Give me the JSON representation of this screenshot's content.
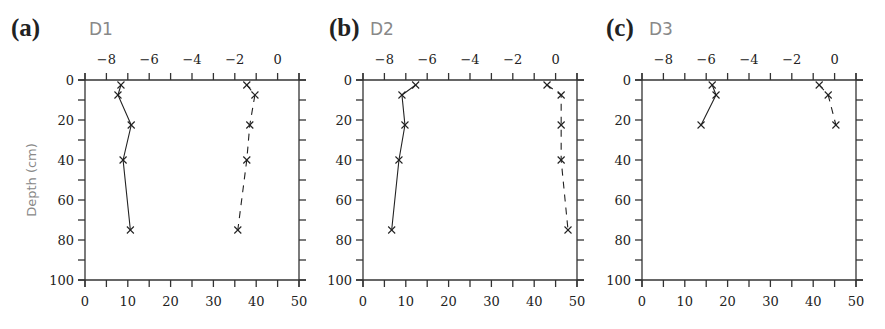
{
  "chart_data": [
    {
      "type": "line",
      "panel_label": "(a)",
      "title": "D1",
      "ylabel": "Depth (cm)",
      "ylim": [
        100,
        0
      ],
      "yticks": [
        0,
        20,
        40,
        60,
        80,
        100
      ],
      "x_bottom": {
        "range": [
          0,
          50
        ],
        "ticks": [
          0,
          10,
          20,
          30,
          40,
          50
        ]
      },
      "x_top": {
        "range": [
          -9,
          1
        ],
        "ticks": [
          -8,
          -6,
          -4,
          -2,
          0
        ]
      },
      "grid": false,
      "series": [
        {
          "name": "solid",
          "style": "solid",
          "marker": "x",
          "axis": "bottom",
          "x": [
            8.4,
            7.7,
            10.8,
            8.9,
            10.6
          ],
          "depth": [
            2.5,
            7.5,
            22.5,
            40,
            75
          ]
        },
        {
          "name": "dashed",
          "style": "dashed",
          "marker": "x",
          "axis": "bottom",
          "x": [
            37.8,
            39.7,
            38.5,
            37.8,
            35.7
          ],
          "depth": [
            2.5,
            7.5,
            22.5,
            40,
            75
          ]
        }
      ]
    },
    {
      "type": "line",
      "panel_label": "(b)",
      "title": "D2",
      "ylim": [
        100,
        0
      ],
      "yticks": [
        0,
        20,
        40,
        60,
        80,
        100
      ],
      "x_bottom": {
        "range": [
          0,
          50
        ],
        "ticks": [
          0,
          10,
          20,
          30,
          40,
          50
        ]
      },
      "x_top": {
        "range": [
          -9,
          1
        ],
        "ticks": [
          -8,
          -6,
          -4,
          -2,
          0
        ]
      },
      "grid": false,
      "series": [
        {
          "name": "solid",
          "style": "solid",
          "marker": "x",
          "axis": "bottom",
          "x": [
            12.3,
            9.1,
            9.8,
            8.4,
            6.7
          ],
          "depth": [
            2.5,
            7.5,
            22.5,
            40,
            75
          ]
        },
        {
          "name": "dashed",
          "style": "dashed",
          "marker": "x",
          "axis": "bottom",
          "x": [
            43.0,
            46.3,
            46.3,
            46.3,
            47.9
          ],
          "depth": [
            2.5,
            7.5,
            22.5,
            40,
            75
          ]
        }
      ]
    },
    {
      "type": "line",
      "panel_label": "(c)",
      "title": "D3",
      "ylim": [
        100,
        0
      ],
      "yticks": [
        0,
        20,
        40,
        60,
        80,
        100
      ],
      "x_bottom": {
        "range": [
          0,
          50
        ],
        "ticks": [
          0,
          10,
          20,
          30,
          40,
          50
        ]
      },
      "x_top": {
        "range": [
          -9,
          1
        ],
        "ticks": [
          -8,
          -6,
          -4,
          -2,
          0
        ]
      },
      "grid": false,
      "series": [
        {
          "name": "solid",
          "style": "solid",
          "marker": "x",
          "axis": "bottom",
          "x": [
            16.4,
            17.3,
            13.8
          ],
          "depth": [
            2.5,
            7.5,
            22.5
          ]
        },
        {
          "name": "dashed",
          "style": "dashed",
          "marker": "x",
          "axis": "bottom",
          "x": [
            41.4,
            43.5,
            45.3
          ],
          "depth": [
            2.5,
            7.5,
            22.5
          ]
        }
      ]
    }
  ]
}
